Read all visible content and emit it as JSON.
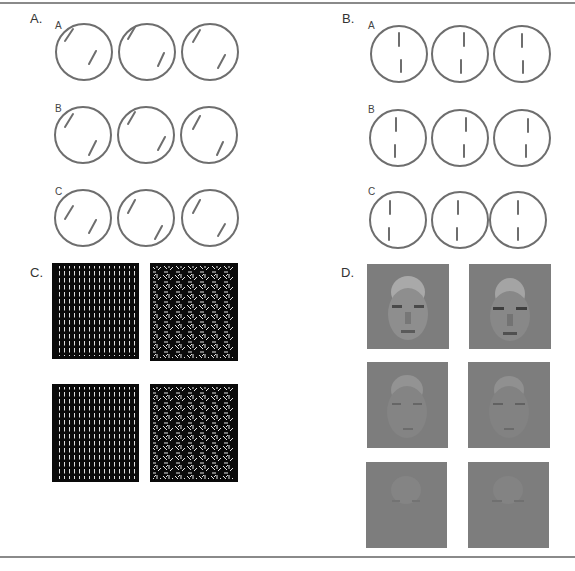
{
  "figure": {
    "panels": [
      {
        "label": "A.",
        "type": "circle-line-pairs",
        "orientation": "oblique",
        "rows": [
          "A",
          "B",
          "C"
        ]
      },
      {
        "label": "B.",
        "type": "circle-line-pairs",
        "orientation": "vertical",
        "rows": [
          "A",
          "B",
          "C"
        ]
      },
      {
        "label": "C.",
        "type": "texture-stimuli",
        "description": "Black squares with white line-element textures: left column aligned vertical elements, right column randomly oriented elements"
      },
      {
        "label": "D.",
        "type": "face-stimuli",
        "description": "Gray noisy face images decreasing in visibility from top row to bottom row"
      }
    ],
    "colors": {
      "circle_stroke": "#6e6e6e",
      "line_stroke": "#6e6e6e",
      "texture_bg": "#0a0a0a",
      "texture_fg": "#e6e6e6",
      "face_bg": "#7d7d7d",
      "rule": "#8a8a8a"
    }
  }
}
